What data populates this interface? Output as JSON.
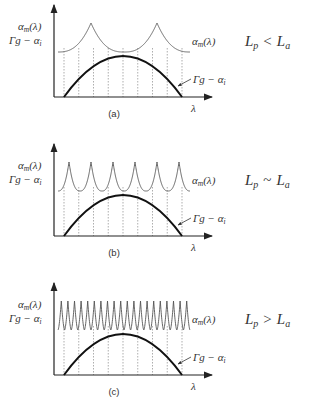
{
  "panels": [
    {
      "id": "a",
      "caption": "(a)",
      "y_label_1": "αm(λ)",
      "y_label_2": "Γg − αi",
      "curve_label_modes": "αm(λ)",
      "curve_label_gain": "Γg − αi",
      "x_label": "λ",
      "condition": "Lp < La",
      "condition_parts": {
        "left": "L",
        "left_sub": "p",
        "op": "<",
        "right": "L",
        "right_sub": "a"
      },
      "mode_peaks": 2
    },
    {
      "id": "b",
      "caption": "(b)",
      "y_label_1": "αm(λ)",
      "y_label_2": "Γg − αi",
      "curve_label_modes": "αm(λ)",
      "curve_label_gain": "Γg − αi",
      "x_label": "λ",
      "condition": "Lp ~ La",
      "condition_parts": {
        "left": "L",
        "left_sub": "p",
        "op": "~",
        "right": "L",
        "right_sub": "a"
      },
      "mode_peaks": 6
    },
    {
      "id": "c",
      "caption": "(c)",
      "y_label_1": "αm(λ)",
      "y_label_2": "Γg − αi",
      "curve_label_modes": "αm(λ)",
      "curve_label_gain": "Γg − αi",
      "x_label": "λ",
      "condition": "Lp > La",
      "condition_parts": {
        "left": "L",
        "left_sub": "p",
        "op": ">",
        "right": "L",
        "right_sub": "a"
      },
      "mode_peaks": 20
    }
  ]
}
